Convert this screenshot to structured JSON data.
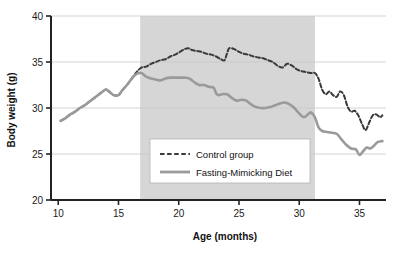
{
  "chart_data": {
    "type": "line",
    "title": "",
    "xlabel": "Age (months)",
    "ylabel": "Body weight (g)",
    "xlim": [
      9.4,
      37.2
    ],
    "ylim": [
      20,
      40
    ],
    "xticks": [
      10,
      15,
      20,
      25,
      30,
      35
    ],
    "yticks": [
      20,
      25,
      30,
      35,
      40
    ],
    "xtick_labels": [
      "10",
      "15",
      "20",
      "25",
      "30",
      "35"
    ],
    "ytick_labels": [
      "20",
      "25",
      "30",
      "35",
      "40"
    ],
    "grid": "horizontal",
    "legend_position": "center",
    "shaded_region": {
      "label": "",
      "x_start": 16.8,
      "x_end": 31.3,
      "color": "#d6d6d6"
    },
    "series": [
      {
        "name": "Control group",
        "style": "dashed",
        "color": "#3a3a3a",
        "x": [
          10.2,
          10.6,
          11.0,
          11.4,
          11.8,
          12.2,
          12.6,
          13.0,
          13.4,
          13.8,
          14.0,
          14.3,
          14.6,
          15.0,
          15.3,
          15.7,
          16.1,
          16.5,
          16.9,
          17.3,
          17.7,
          18.1,
          18.5,
          18.9,
          19.3,
          19.7,
          20.1,
          20.5,
          20.8,
          21.1,
          21.5,
          21.9,
          22.3,
          22.7,
          23.1,
          23.5,
          23.8,
          24.0,
          24.2,
          24.6,
          25.0,
          25.4,
          25.8,
          26.2,
          26.6,
          27.0,
          27.4,
          27.8,
          28.2,
          28.6,
          29.0,
          29.4,
          29.8,
          30.2,
          30.6,
          31.0,
          31.3,
          31.6,
          31.9,
          32.2,
          32.5,
          32.8,
          33.1,
          33.4,
          33.7,
          34.0,
          34.3,
          34.6,
          34.9,
          35.2,
          35.5,
          35.8,
          36.1,
          36.4,
          36.7,
          36.9
        ],
        "y": [
          28.6,
          28.9,
          29.3,
          29.6,
          30.0,
          30.3,
          30.7,
          31.1,
          31.5,
          31.9,
          32.0,
          31.7,
          31.4,
          31.4,
          31.9,
          32.5,
          33.2,
          33.9,
          34.4,
          34.5,
          34.8,
          35.0,
          35.2,
          35.3,
          35.6,
          35.8,
          36.1,
          36.4,
          36.5,
          36.3,
          36.2,
          36.1,
          35.9,
          35.8,
          35.6,
          35.3,
          35.2,
          35.9,
          36.5,
          36.4,
          36.1,
          35.9,
          35.8,
          35.6,
          35.5,
          35.4,
          35.2,
          35.0,
          34.6,
          34.4,
          34.8,
          34.6,
          34.2,
          34.0,
          33.9,
          33.8,
          33.8,
          33.2,
          32.0,
          31.5,
          31.8,
          31.4,
          31.2,
          31.8,
          31.4,
          30.2,
          29.6,
          29.7,
          29.2,
          28.3,
          27.6,
          28.4,
          29.2,
          29.3,
          29.0,
          29.2
        ]
      },
      {
        "name": "Fasting-Mimicking Diet",
        "style": "solid",
        "color": "#9a9a9a",
        "x": [
          10.2,
          10.6,
          11.0,
          11.4,
          11.8,
          12.2,
          12.6,
          13.0,
          13.4,
          13.8,
          14.0,
          14.3,
          14.6,
          15.0,
          15.3,
          15.7,
          16.1,
          16.5,
          16.9,
          17.3,
          17.7,
          18.1,
          18.5,
          18.9,
          19.3,
          19.7,
          20.1,
          20.5,
          20.9,
          21.3,
          21.7,
          22.1,
          22.5,
          22.9,
          23.1,
          23.3,
          23.6,
          24.0,
          24.4,
          24.8,
          25.2,
          25.6,
          26.0,
          26.4,
          26.8,
          27.2,
          27.6,
          28.0,
          28.4,
          28.8,
          29.2,
          29.6,
          30.0,
          30.4,
          30.8,
          31.0,
          31.3,
          31.6,
          31.9,
          32.3,
          32.7,
          33.1,
          33.5,
          33.9,
          34.3,
          34.7,
          35.0,
          35.3,
          35.6,
          35.9,
          36.2,
          36.5,
          36.9
        ],
        "y": [
          28.6,
          28.9,
          29.3,
          29.6,
          30.0,
          30.3,
          30.7,
          31.1,
          31.5,
          31.9,
          32.0,
          31.7,
          31.4,
          31.4,
          31.9,
          32.5,
          33.2,
          33.7,
          33.8,
          33.4,
          33.2,
          33.1,
          33.0,
          33.2,
          33.3,
          33.3,
          33.3,
          33.3,
          33.2,
          32.8,
          32.5,
          32.5,
          32.3,
          32.2,
          31.6,
          31.4,
          31.5,
          31.5,
          31.1,
          30.8,
          30.9,
          30.8,
          30.4,
          30.1,
          30.0,
          30.0,
          30.1,
          30.3,
          30.5,
          30.6,
          30.4,
          30.0,
          29.4,
          29.0,
          29.4,
          29.5,
          29.0,
          27.9,
          27.5,
          27.4,
          27.3,
          27.2,
          26.6,
          26.0,
          25.6,
          25.5,
          24.9,
          25.3,
          25.7,
          25.6,
          25.9,
          26.3,
          26.4
        ]
      }
    ]
  },
  "legend": {
    "items": [
      {
        "label": "Control group",
        "style": "dashed",
        "color": "#3a3a3a"
      },
      {
        "label": "Fasting-Mimicking Diet",
        "style": "solid",
        "color": "#9a9a9a"
      }
    ]
  },
  "colors": {
    "background": "#ffffff",
    "axis": "#222222",
    "grid": "#c8c8c8",
    "shade": "#d6d6d6",
    "control": "#3a3a3a",
    "fmd": "#9a9a9a"
  }
}
